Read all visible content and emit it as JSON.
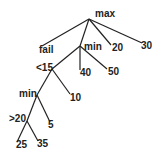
{
  "diagram": {
    "type": "game-tree",
    "colors": {
      "line": "#222222",
      "text": "#222222",
      "background": "#ffffff"
    },
    "nodes": [
      {
        "id": "root",
        "label": "max",
        "x": 89,
        "y": 19,
        "lx": 95,
        "ly": 17
      },
      {
        "id": "fail",
        "label": "fail",
        "x": 42,
        "y": 46,
        "lx": 39,
        "ly": 53
      },
      {
        "id": "min1",
        "label": "min",
        "x": 80,
        "y": 46,
        "lx": 84,
        "ly": 50
      },
      {
        "id": "n20",
        "label": "20",
        "x": 111,
        "y": 45,
        "lx": 112,
        "ly": 51
      },
      {
        "id": "n30",
        "label": "30",
        "x": 142,
        "y": 43,
        "lx": 141,
        "ly": 49
      },
      {
        "id": "lt15",
        "label": "<15",
        "x": 52,
        "y": 69,
        "lx": 36,
        "ly": 71
      },
      {
        "id": "n40",
        "label": "40",
        "x": 80,
        "y": 70,
        "lx": 80,
        "ly": 76
      },
      {
        "id": "n50",
        "label": "50",
        "x": 107,
        "y": 69,
        "lx": 108,
        "ly": 75
      },
      {
        "id": "min2",
        "label": "min",
        "x": 37,
        "y": 95,
        "lx": 19,
        "ly": 97
      },
      {
        "id": "n10",
        "label": "10",
        "x": 70,
        "y": 94,
        "lx": 70,
        "ly": 101
      },
      {
        "id": "gt20",
        "label": ">20",
        "x": 27,
        "y": 121,
        "lx": 9,
        "ly": 122
      },
      {
        "id": "n5",
        "label": "5",
        "x": 50,
        "y": 122,
        "lx": 48,
        "ly": 128
      },
      {
        "id": "n25",
        "label": "25",
        "x": 17,
        "y": 142,
        "lx": 16,
        "ly": 148
      },
      {
        "id": "n35",
        "label": "35",
        "x": 38,
        "y": 141,
        "lx": 37,
        "ly": 147
      }
    ],
    "edges": [
      [
        "root",
        "fail"
      ],
      [
        "root",
        "min1"
      ],
      [
        "root",
        "n20"
      ],
      [
        "root",
        "n30"
      ],
      [
        "min1",
        "lt15"
      ],
      [
        "min1",
        "n40"
      ],
      [
        "min1",
        "n50"
      ],
      [
        "lt15",
        "min2"
      ],
      [
        "lt15",
        "n10"
      ],
      [
        "min2",
        "gt20"
      ],
      [
        "min2",
        "n5"
      ],
      [
        "gt20",
        "n25"
      ],
      [
        "gt20",
        "n35"
      ]
    ]
  }
}
